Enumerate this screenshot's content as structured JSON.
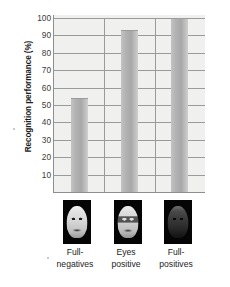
{
  "chart_data": {
    "type": "bar",
    "title": "",
    "subtitle": "",
    "xlabel": "",
    "ylabel": "Recognition performance (%)",
    "categories": [
      "Full-negatives",
      "Eyes positive",
      "Full-positives"
    ],
    "category_lines": [
      [
        "Full-",
        "negatives"
      ],
      [
        "Eyes",
        "positive"
      ],
      [
        "Full-",
        "positives"
      ]
    ],
    "values": [
      54,
      93,
      100
    ],
    "ylim": [
      0,
      100
    ],
    "yticks": [
      10,
      20,
      30,
      40,
      50,
      60,
      70,
      80,
      90,
      100
    ],
    "ytick_labels": [
      "10",
      "20",
      "30",
      "40",
      "50",
      "60",
      "70",
      "80",
      "90",
      "100"
    ],
    "grid": true,
    "grid_axis": "y",
    "legend": "none",
    "bar_color": "#b2b2b2",
    "plot_background": "#f0f0ee",
    "axis_color": "#8e8e8e",
    "grid_color": "#9a9a9a",
    "text_color": "#1c1c1c"
  },
  "stimuli": {
    "caption": "Face stimulus thumbnails shown beneath each bar",
    "items": [
      {
        "name": "full-negative-face",
        "icon": "face-negative-thumbnail",
        "background": "#050505"
      },
      {
        "name": "eyes-positive-face",
        "icon": "face-eyes-positive-thumbnail",
        "background": "#050505"
      },
      {
        "name": "full-positive-face",
        "icon": "face-positive-thumbnail",
        "background": "#050505"
      }
    ]
  }
}
